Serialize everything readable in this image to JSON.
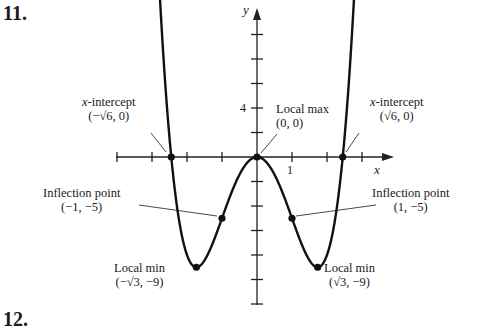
{
  "problem_number": "11.",
  "next_problem_number": "12.",
  "axes": {
    "x_label": "x",
    "y_label": "y",
    "x_tick_label": "1",
    "y_tick_label": "4"
  },
  "annotations": {
    "x_int_left": {
      "title_var": "x",
      "title_rest": "-intercept",
      "coords": "(−√6, 0)"
    },
    "x_int_right": {
      "title_var": "x",
      "title_rest": "-intercept",
      "coords": "(√6, 0)"
    },
    "local_max": {
      "title": "Local max",
      "coords": "(0, 0)"
    },
    "infl_left": {
      "title": "Inflection point",
      "coords": "(−1, −5)"
    },
    "infl_right": {
      "title": "Inflection point",
      "coords": "(1, −5)"
    },
    "min_left": {
      "title": "Local min",
      "coords": "(−√3, −9)"
    },
    "min_right": {
      "title": "Local min",
      "coords": "(√3, −9)"
    }
  },
  "chart_data": {
    "type": "line",
    "title": "",
    "function": "y = x^4 - 6x^2",
    "xlabel": "x",
    "ylabel": "y",
    "xlim": [
      -4,
      4
    ],
    "ylim": [
      -12,
      12
    ],
    "x_tick_spacing": 1,
    "y_tick_spacing": 2,
    "labeled_ticks": {
      "x": [
        1
      ],
      "y": [
        4
      ]
    },
    "key_points": [
      {
        "label": "x-intercept",
        "x": -2.449,
        "y": 0,
        "display": "(−√6, 0)"
      },
      {
        "label": "Local max",
        "x": 0,
        "y": 0,
        "display": "(0, 0)"
      },
      {
        "label": "x-intercept",
        "x": 2.449,
        "y": 0,
        "display": "(√6, 0)"
      },
      {
        "label": "Inflection point",
        "x": -1,
        "y": -5,
        "display": "(−1, −5)"
      },
      {
        "label": "Inflection point",
        "x": 1,
        "y": -5,
        "display": "(1, −5)"
      },
      {
        "label": "Local min",
        "x": -1.732,
        "y": -9,
        "display": "(−√3, −9)"
      },
      {
        "label": "Local min",
        "x": 1.732,
        "y": -9,
        "display": "(√3, −9)"
      }
    ],
    "grid": false
  }
}
